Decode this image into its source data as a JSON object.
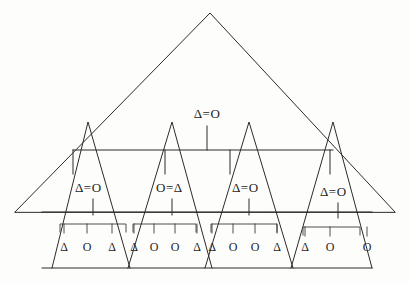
{
  "figure": {
    "background_color": "#fdfdfc",
    "stroke_color": "#2b2b2b"
  },
  "root": {
    "name": "outer-triangle",
    "apex": {
      "x": 210,
      "y": 13
    },
    "base_left": {
      "x": 15,
      "y": 212
    },
    "base_right": {
      "x": 395,
      "y": 212
    },
    "label": ""
  },
  "level2": {
    "name": "second-level-span",
    "bar": {
      "x1": 73,
      "x2": 333,
      "y": 150
    },
    "label": "Δ=O",
    "label_x": 207,
    "label_y": 118,
    "stem": {
      "x": 207,
      "y1": 126,
      "y2": 150
    },
    "ticks": [
      73,
      165,
      230,
      330
    ]
  },
  "level3": {
    "name": "third-level-bar",
    "bar": {
      "x1": 42,
      "x2": 372,
      "y": 212
    }
  },
  "baseline": {
    "name": "bottom-baseline",
    "bar": {
      "x1": 42,
      "x2": 372,
      "y": 268
    }
  },
  "groups": [
    {
      "id": "group-1",
      "label": "Δ=O",
      "label_x": 75,
      "label_y": 192,
      "stem": {
        "x": 93,
        "y1": 199,
        "y2": 215
      },
      "triangle": {
        "apex_x": 88,
        "apex_y": 122,
        "base_left": 52,
        "base_right": 130,
        "base_y": 268
      },
      "bracket": {
        "x1": 60,
        "x2": 126,
        "y": 224
      },
      "leaves": [
        {
          "symbol": "Δ",
          "x": 64
        },
        {
          "symbol": "O",
          "x": 87
        },
        {
          "symbol": "Δ",
          "x": 112
        }
      ],
      "leaf_y": 251
    },
    {
      "id": "group-2",
      "label": "O=Δ",
      "label_x": 156,
      "label_y": 192,
      "stem": {
        "x": 172,
        "y1": 199,
        "y2": 215
      },
      "triangle": {
        "apex_x": 172,
        "apex_y": 122,
        "base_left": 128,
        "base_right": 212,
        "base_y": 268
      },
      "bracket": {
        "x1": 133,
        "x2": 196,
        "y": 224
      },
      "leaves": [
        {
          "symbol": "Δ",
          "x": 134
        },
        {
          "symbol": "O",
          "x": 154
        },
        {
          "symbol": "O",
          "x": 175
        },
        {
          "symbol": "Δ",
          "x": 197
        }
      ],
      "leaf_y": 251
    },
    {
      "id": "group-3",
      "label": "Δ=O",
      "label_x": 232,
      "label_y": 192,
      "stem": {
        "x": 249,
        "y1": 199,
        "y2": 215
      },
      "triangle": {
        "apex_x": 249,
        "apex_y": 122,
        "base_left": 205,
        "base_right": 293,
        "base_y": 268
      },
      "bracket": {
        "x1": 211,
        "x2": 277,
        "y": 224
      },
      "leaves": [
        {
          "symbol": "Δ",
          "x": 212
        },
        {
          "symbol": "O",
          "x": 233
        },
        {
          "symbol": "O",
          "x": 255
        },
        {
          "symbol": "Δ",
          "x": 277
        }
      ],
      "leaf_y": 251
    },
    {
      "id": "group-4",
      "label": "Δ=O",
      "label_x": 320,
      "label_y": 196,
      "stem": {
        "x": 338,
        "y1": 203,
        "y2": 218
      },
      "triangle": {
        "apex_x": 333,
        "apex_y": 122,
        "base_left": 291,
        "base_right": 372,
        "base_y": 268
      },
      "bracket": {
        "x1": 303,
        "x2": 360,
        "y": 227
      },
      "leaves": [
        {
          "symbol": "Δ",
          "x": 305
        },
        {
          "symbol": "O",
          "x": 330
        },
        {
          "symbol": "O",
          "x": 367
        }
      ],
      "leaf_y": 251
    }
  ],
  "symbols": {
    "triangle_glyph": "Δ",
    "circle_glyph": "O",
    "equals_glyph": "="
  }
}
